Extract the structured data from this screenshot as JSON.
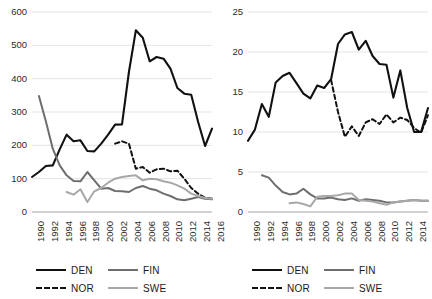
{
  "figure": {
    "background": "#ffffff",
    "panel_count": 2
  },
  "series_styles": {
    "DEN": {
      "color": "#111111",
      "dash": "solid",
      "width": 2.1
    },
    "NOR": {
      "color": "#111111",
      "dash": "dashed",
      "width": 2.0
    },
    "FIN": {
      "color": "#6e6e6e",
      "dash": "solid",
      "width": 2.0
    },
    "SWE": {
      "color": "#a8a8a8",
      "dash": "solid",
      "width": 2.0
    }
  },
  "legend_left": {
    "position": "bottom",
    "items": [
      {
        "label": "DEN",
        "style": "solid",
        "color": "#111111"
      },
      {
        "label": "FIN",
        "style": "solid",
        "color": "#6e6e6e"
      },
      {
        "label": "NOR",
        "style": "dashed",
        "color": "#111111"
      },
      {
        "label": "SWE",
        "style": "solid",
        "color": "#a8a8a8"
      }
    ]
  },
  "legend_right": {
    "position": "bottom",
    "items": [
      {
        "label": "DEN",
        "style": "solid",
        "color": "#111111"
      },
      {
        "label": "FIN",
        "style": "solid",
        "color": "#6e6e6e"
      },
      {
        "label": "NOR",
        "style": "dashed",
        "color": "#111111"
      },
      {
        "label": "SWE",
        "style": "solid",
        "color": "#a8a8a8"
      }
    ]
  },
  "chart_data": [
    {
      "id": "left",
      "type": "line",
      "title": "",
      "xlabel": "",
      "ylabel": "",
      "grid": true,
      "legend_position": "bottom",
      "xlim": [
        1990,
        2016
      ],
      "ylim": [
        0,
        600
      ],
      "yticks": [
        0,
        100,
        200,
        300,
        400,
        500,
        600
      ],
      "ytick_labels": [
        "0",
        "100",
        "200",
        "300",
        "400",
        "500",
        "600"
      ],
      "xticks": [
        1990,
        1992,
        1994,
        1996,
        1998,
        2000,
        2002,
        2004,
        2006,
        2008,
        2010,
        2012,
        2014,
        2016
      ],
      "xtick_labels": [
        "1990",
        "1992",
        "1994",
        "1996",
        "1998",
        "2000",
        "2002",
        "2004",
        "2006",
        "2008",
        "2010",
        "2012",
        "2014",
        "2016"
      ],
      "x": [
        1990,
        1991,
        1992,
        1993,
        1994,
        1995,
        1996,
        1997,
        1998,
        1999,
        2000,
        2001,
        2002,
        2003,
        2004,
        2005,
        2006,
        2007,
        2008,
        2009,
        2010,
        2011,
        2012,
        2013,
        2014,
        2015,
        2016
      ],
      "series": [
        {
          "name": "DEN",
          "values": [
            105,
            120,
            138,
            140,
            188,
            232,
            212,
            215,
            183,
            182,
            205,
            232,
            262,
            263,
            420,
            545,
            523,
            452,
            465,
            460,
            430,
            372,
            355,
            352,
            270,
            198,
            250
          ]
        },
        {
          "name": "NOR",
          "values": [
            null,
            null,
            null,
            null,
            null,
            null,
            null,
            null,
            null,
            null,
            null,
            null,
            205,
            212,
            205,
            130,
            135,
            118,
            128,
            130,
            122,
            124,
            100,
            72,
            55,
            43,
            40
          ]
        },
        {
          "name": "FIN",
          "values": [
            null,
            348,
            272,
            190,
            140,
            110,
            93,
            92,
            120,
            95,
            70,
            72,
            63,
            62,
            60,
            72,
            78,
            70,
            65,
            55,
            48,
            38,
            35,
            40,
            45,
            40,
            38
          ]
        },
        {
          "name": "SWE",
          "values": [
            null,
            null,
            null,
            null,
            null,
            60,
            52,
            68,
            30,
            62,
            72,
            88,
            100,
            105,
            108,
            110,
            95,
            100,
            98,
            92,
            88,
            80,
            70,
            55,
            48,
            42,
            40
          ]
        }
      ]
    },
    {
      "id": "right",
      "type": "line",
      "title": "",
      "xlabel": "",
      "ylabel": "",
      "grid": true,
      "legend_position": "bottom",
      "xlim": [
        1990,
        2016
      ],
      "ylim": [
        0,
        25
      ],
      "yticks": [
        0,
        5,
        10,
        15,
        20,
        25
      ],
      "ytick_labels": [
        "0",
        "5",
        "10",
        "15",
        "20",
        "25"
      ],
      "xticks": [
        1990,
        1992,
        1994,
        1996,
        1998,
        2000,
        2002,
        2004,
        2006,
        2008,
        2010,
        2012,
        2014,
        2016
      ],
      "xtick_labels": [
        "1990",
        "1992",
        "1994",
        "1996",
        "1998",
        "2000",
        "2002",
        "2004",
        "2006",
        "2008",
        "2010",
        "2012",
        "2014",
        "2016"
      ],
      "x": [
        1990,
        1991,
        1992,
        1993,
        1994,
        1995,
        1996,
        1997,
        1998,
        1999,
        2000,
        2001,
        2002,
        2003,
        2004,
        2005,
        2006,
        2007,
        2008,
        2009,
        2010,
        2011,
        2012,
        2013,
        2014,
        2015,
        2016
      ],
      "series": [
        {
          "name": "DEN",
          "values": [
            8.9,
            10.3,
            13.5,
            11.9,
            16.2,
            17.0,
            17.4,
            16.1,
            14.8,
            14.2,
            15.8,
            15.5,
            16.6,
            21.0,
            22.2,
            22.5,
            20.3,
            21.4,
            19.5,
            18.5,
            18.4,
            14.3,
            17.7,
            13.0,
            10.0,
            10.0,
            13.0
          ]
        },
        {
          "name": "NOR",
          "values": [
            null,
            null,
            null,
            null,
            null,
            null,
            null,
            null,
            null,
            null,
            null,
            null,
            16.5,
            12.5,
            9.4,
            10.7,
            9.5,
            11.2,
            11.6,
            11.0,
            12.2,
            11.2,
            11.8,
            11.5,
            10.5,
            9.9,
            12.1
          ]
        },
        {
          "name": "FIN",
          "values": [
            null,
            null,
            4.6,
            4.3,
            3.3,
            2.5,
            2.2,
            2.3,
            2.9,
            2.2,
            1.7,
            1.7,
            1.8,
            1.6,
            1.5,
            1.7,
            1.4,
            1.6,
            1.5,
            1.4,
            1.2,
            1.2,
            1.3,
            1.4,
            1.5,
            1.4,
            1.4
          ]
        },
        {
          "name": "SWE",
          "values": [
            null,
            null,
            null,
            null,
            null,
            null,
            1.1,
            1.2,
            1.0,
            0.7,
            1.9,
            2.0,
            2.0,
            2.1,
            2.3,
            2.3,
            1.5,
            1.4,
            1.3,
            1.1,
            0.9,
            1.2,
            1.3,
            1.4,
            1.5,
            1.4,
            1.4
          ]
        }
      ]
    }
  ]
}
